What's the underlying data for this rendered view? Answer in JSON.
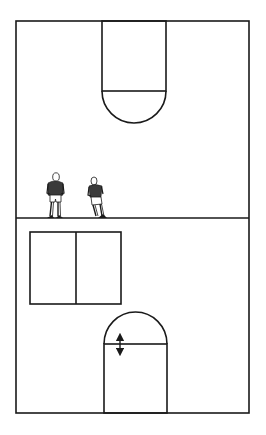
{
  "diagram": {
    "title": "Half-court drill diagram with two players at midcourt",
    "canvas": {
      "width": 266,
      "height": 435
    },
    "colors": {
      "background": "#ffffff",
      "line": "#1a1a1a",
      "jersey": "#3a3a3a",
      "skin": "#ffffff"
    },
    "court": {
      "outline": {
        "x": 16,
        "y": 21,
        "width": 233,
        "height": 392
      },
      "midcourt_line_y": 218
    },
    "top_lane": {
      "x": 102,
      "y": 21,
      "width": 64,
      "free_throw_y": 91,
      "arc_bottom_y": 123
    },
    "bottom_lane": {
      "x": 104,
      "y": 344,
      "width": 63,
      "baseline_y": 413,
      "arc_top_y": 312
    },
    "box": {
      "x": 30,
      "y": 232,
      "width": 91,
      "height": 72,
      "divider_x": 76
    },
    "arrow": {
      "type": "double-headed vertical",
      "x": 120,
      "y_top": 334,
      "y_bottom": 355
    },
    "players": [
      {
        "label": "Player 1",
        "x": 55,
        "feet_y": 218,
        "pose": "standing"
      },
      {
        "label": "Player 2",
        "x": 97,
        "feet_y": 218,
        "pose": "leaning-running"
      }
    ]
  }
}
